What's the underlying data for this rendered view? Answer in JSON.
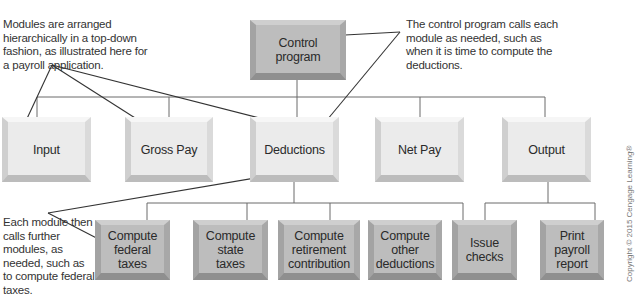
{
  "diagram": {
    "type": "hierarchy-chart",
    "root": {
      "label": "Control program"
    },
    "level2": [
      {
        "label": "Input"
      },
      {
        "label": "Gross Pay"
      },
      {
        "label": "Deductions"
      },
      {
        "label": "Net Pay"
      },
      {
        "label": "Output"
      }
    ],
    "level3_deductions": [
      {
        "label": "Compute federal taxes"
      },
      {
        "label": "Compute state taxes"
      },
      {
        "label": "Compute retirement contribution"
      },
      {
        "label": "Compute other deductions"
      }
    ],
    "level3_output": [
      {
        "label": "Issue checks"
      },
      {
        "label": "Print payroll report"
      }
    ],
    "annotations": {
      "top_left": "Modules are arranged hierarchically in a top-down fashion, as illustrated here for a payroll application.",
      "top_right": "The control program calls each module as needed, such as when it is time to compute the deductions.",
      "bottom_left": "Each module then calls further modules, as needed, such as to compute federal taxes."
    },
    "copyright": "Copyright © 2015 Cengage Learning®"
  },
  "colors": {
    "top_and_bottom_boxes": "#bdbdbd",
    "middle_boxes": "#ebebeb",
    "lines": "#555555"
  }
}
